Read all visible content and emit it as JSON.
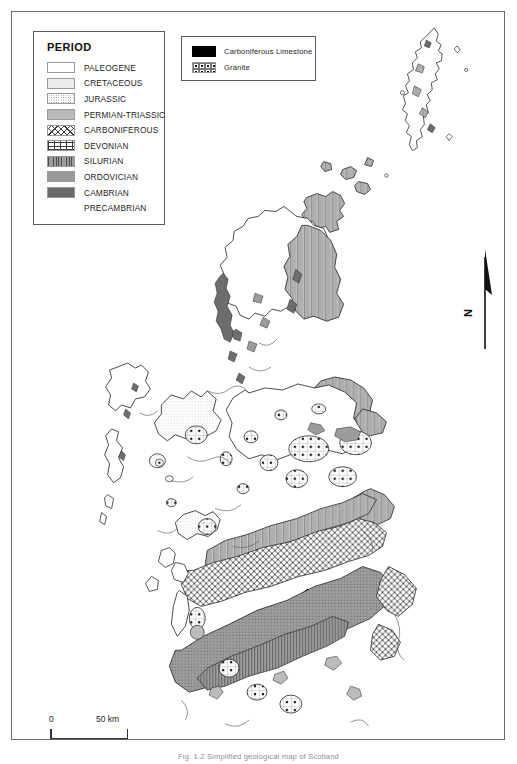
{
  "figure": {
    "caption": "Fig. 1.2  Simplified geological map of Scotland"
  },
  "period_legend": {
    "title": "PERIOD",
    "items": [
      {
        "label": "PALEOGENE",
        "pattern": "p-paleogene",
        "color": "#ffffff"
      },
      {
        "label": "CRETACEOUS",
        "pattern": "p-cretaceous",
        "color": "#ececec"
      },
      {
        "label": "JURASSIC",
        "pattern": "p-jurassic",
        "color": "#ffffff"
      },
      {
        "label": "PERMIAN-TRIASSIC",
        "pattern": "p-permian",
        "color": "#b9b9b9"
      },
      {
        "label": "CARBONIFEROUS",
        "pattern": "p-carboniferous",
        "color": "#ffffff"
      },
      {
        "label": "DEVONIAN",
        "pattern": "p-devonian",
        "color": "#ffffff"
      },
      {
        "label": "SILURIAN",
        "pattern": "p-silurian",
        "color": "#9d9d9d"
      },
      {
        "label": "ORDOVICIAN",
        "pattern": "p-ordovician",
        "color": "#9a9a9a"
      },
      {
        "label": "CAMBRIAN",
        "pattern": "p-cambrian",
        "color": "#6a6a6a"
      },
      {
        "label": "PRECAMBRIAN",
        "pattern": "p-precambrian",
        "color": "#ffffff"
      }
    ]
  },
  "unit_legend": {
    "items": [
      {
        "label": "Carboniferous Limestone",
        "pattern": "p-limestone",
        "color": "#000000"
      },
      {
        "label": "Granite",
        "pattern": "p-granite",
        "color": "#ffffff"
      }
    ]
  },
  "north_arrow": {
    "label": "N"
  },
  "scale_bar": {
    "min_label": "0",
    "max_label": "50 km",
    "length_km": 50
  },
  "map": {
    "region": "Scotland",
    "projection_note": "",
    "areas": [
      {
        "name": "Shetland",
        "period": "PRECAMBRIAN"
      },
      {
        "name": "Orkney",
        "period": "DEVONIAN"
      },
      {
        "name": "Caithness",
        "period": "DEVONIAN"
      },
      {
        "name": "Outer Hebrides",
        "period": "PRECAMBRIAN"
      },
      {
        "name": "Skye",
        "period": "PALEOGENE"
      },
      {
        "name": "Mull",
        "period": "PALEOGENE"
      },
      {
        "name": "NW Highlands",
        "period": "PRECAMBRIAN"
      },
      {
        "name": "Moine Thrust Belt",
        "period": "CAMBRIAN"
      },
      {
        "name": "Grampian Highlands",
        "period": "PRECAMBRIAN"
      },
      {
        "name": "Midland Valley",
        "period": "CARBONIFEROUS"
      },
      {
        "name": "Southern Uplands",
        "period": "ORDOVICIAN"
      },
      {
        "name": "Solway Basin",
        "period": "PERMIAN-TRIASSIC"
      }
    ]
  }
}
